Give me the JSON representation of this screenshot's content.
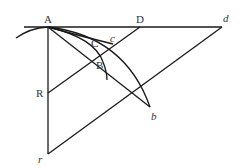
{
  "diagram": {
    "type": "geometric-construction",
    "points": [
      {
        "id": "A",
        "label": "A",
        "italic": false,
        "x": 48,
        "y": 27
      },
      {
        "id": "D",
        "label": "D",
        "italic": false,
        "x": 140,
        "y": 27
      },
      {
        "id": "d",
        "label": "d",
        "italic": true,
        "x": 222,
        "y": 27
      },
      {
        "id": "C",
        "label": "C",
        "italic": false,
        "x": 96,
        "y": 48
      },
      {
        "id": "c",
        "label": "c",
        "italic": true,
        "x": 113,
        "y": 44
      },
      {
        "id": "B",
        "label": "B",
        "italic": false,
        "x": 101,
        "y": 56
      },
      {
        "id": "R",
        "label": "R",
        "italic": false,
        "x": 48,
        "y": 93
      },
      {
        "id": "b",
        "label": "b",
        "italic": true,
        "x": 150,
        "y": 107
      },
      {
        "id": "r",
        "label": "r",
        "italic": true,
        "x": 48,
        "y": 154
      }
    ],
    "labels": {
      "A": "A",
      "D": "D",
      "d": "d",
      "C": "C",
      "c": "c",
      "B": "B",
      "R": "R",
      "b": "b",
      "r": "r"
    },
    "segments": [
      {
        "from": "A",
        "to": "d",
        "name": "horizontal-line"
      },
      {
        "from": "A",
        "to": "r",
        "name": "vertical-line"
      },
      {
        "from": "D",
        "to": "R",
        "name": "line-DR"
      },
      {
        "from": "d",
        "to": "r",
        "name": "line-dr"
      },
      {
        "from": "A",
        "to": "b",
        "name": "line-Ab"
      }
    ],
    "arcs": [
      {
        "name": "arc-outer",
        "through": [
          "A",
          "b"
        ]
      },
      {
        "name": "arc-inner",
        "through": [
          "A",
          "B"
        ]
      },
      {
        "name": "arc-chord-AC",
        "through": [
          "A",
          "c"
        ]
      }
    ],
    "colors": {
      "stroke": "#1a1a1a",
      "label": "#333333",
      "background": "#ffffff"
    }
  }
}
